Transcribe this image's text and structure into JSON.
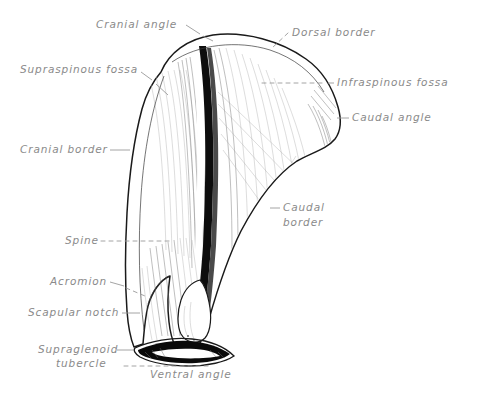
{
  "figure": {
    "subject": "scapula",
    "background_color": "#ffffff",
    "ink_color": "#1a1a1a",
    "label_color": "#8a8a8a",
    "leader_color": "#9a9a9a",
    "width": 489,
    "height": 394
  },
  "labels": [
    {
      "id": "cranial-angle",
      "text": "Cranial angle",
      "x": 96,
      "y": 28,
      "anchor": "start",
      "leader": "solid"
    },
    {
      "id": "dorsal-border",
      "text": "Dorsal border",
      "x": 292,
      "y": 36,
      "anchor": "start",
      "leader": "dashed"
    },
    {
      "id": "supraspinous-fossa",
      "text": "Supraspinous fossa",
      "x": 20,
      "y": 73,
      "anchor": "start",
      "leader": "solid"
    },
    {
      "id": "infraspinous-fossa",
      "text": "Infraspinous fossa",
      "x": 337,
      "y": 86,
      "anchor": "start",
      "leader": "dashed"
    },
    {
      "id": "caudal-angle",
      "text": "Caudal angle",
      "x": 352,
      "y": 121,
      "anchor": "start",
      "leader": "solid"
    },
    {
      "id": "cranial-border",
      "text": "Cranial border",
      "x": 20,
      "y": 153,
      "anchor": "start",
      "leader": "solid"
    },
    {
      "id": "caudal-border",
      "text": "Caudal border",
      "line1": "Caudal",
      "line2": "border",
      "x": 283,
      "y": 211,
      "anchor": "start",
      "leader": "solid"
    },
    {
      "id": "spine",
      "text": "Spine",
      "x": 65,
      "y": 244,
      "anchor": "start",
      "leader": "dashed"
    },
    {
      "id": "acromion",
      "text": "Acromion",
      "x": 50,
      "y": 285,
      "anchor": "start",
      "leader": "solid"
    },
    {
      "id": "scapular-notch",
      "text": "Scapular notch",
      "x": 28,
      "y": 316,
      "anchor": "start",
      "leader": "solid"
    },
    {
      "id": "supraglenoid-tubercle",
      "text": "Supraglenoid tubercle",
      "line1": "Supraglenoid",
      "line2": "tubercle",
      "x": 38,
      "y": 353,
      "anchor": "start",
      "leader": "solid"
    },
    {
      "id": "ventral-angle",
      "text": "Ventral angle",
      "x": 150,
      "y": 378,
      "anchor": "start",
      "leader": "dashed"
    }
  ]
}
